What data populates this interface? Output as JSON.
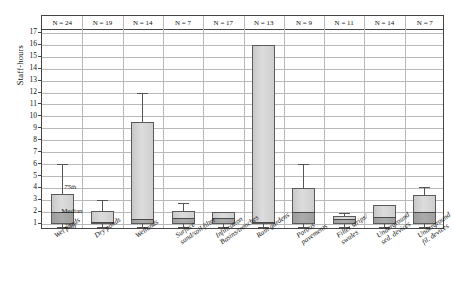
{
  "chart_data": {
    "type": "box",
    "title": "",
    "xlabel": "",
    "ylabel": "Staff-hours",
    "ylim": [
      0.6,
      17
    ],
    "yticks": [
      1,
      2,
      3,
      4,
      5,
      6,
      7,
      8,
      9,
      10,
      11,
      12,
      13,
      14,
      15,
      16,
      17
    ],
    "grid": true,
    "legend": "none",
    "annotations": [
      {
        "text": "75th",
        "refers_to": "box upper edge (75th percentile)"
      },
      {
        "text": "Median",
        "refers_to": "median line inside box"
      },
      {
        "text": "25th",
        "refers_to": "box lower edge (25th percentile)"
      }
    ],
    "categories": [
      "Wet ponds",
      "Dry ponds",
      "Wetlands",
      "Surface sand/soil filter",
      "Infiltration Basins/trenches",
      "Rain gardens",
      "Porous pavements",
      "Filter strips/swales",
      "Underground sed. devices",
      "Underground fil. devices"
    ],
    "category_labels": [
      [
        "Wet ponds"
      ],
      [
        "Dry ponds"
      ],
      [
        "Wetlands"
      ],
      [
        "Surface",
        "sand/soil filter"
      ],
      [
        "Infiltration",
        "Basins/trenches"
      ],
      [
        "Rain gardens"
      ],
      [
        "Porous",
        "pavements"
      ],
      [
        "Filter strips/",
        "swales"
      ],
      [
        "Underground",
        "sed. devices"
      ],
      [
        "Underground",
        "fil. devices"
      ]
    ],
    "n_label_prefix": "N = ",
    "n_values": [
      24,
      19,
      14,
      7,
      17,
      13,
      9,
      11,
      14,
      7
    ],
    "n_labels": [
      "N = 24",
      "N = 19",
      "N = 14",
      "N = 7",
      "N = 17",
      "N = 13",
      "N = 9",
      "N = 11",
      "N = 14",
      "N = 7"
    ],
    "boxes": [
      {
        "category": "Wet ponds",
        "whisker_low": 1.0,
        "q1": 1.0,
        "median": 2.0,
        "q3": 3.5,
        "whisker_high": 6.0
      },
      {
        "category": "Dry ponds",
        "whisker_low": 1.0,
        "q1": 1.0,
        "median": 1.2,
        "q3": 2.1,
        "whisker_high": 3.0
      },
      {
        "category": "Wetlands",
        "whisker_low": 1.0,
        "q1": 1.0,
        "median": 1.4,
        "q3": 9.5,
        "whisker_high": 12.0
      },
      {
        "category": "Surface sand/soil filter",
        "whisker_low": 1.0,
        "q1": 1.0,
        "median": 1.5,
        "q3": 2.1,
        "whisker_high": 2.8
      },
      {
        "category": "Infiltration Basins/trenches",
        "whisker_low": 1.0,
        "q1": 1.0,
        "median": 1.5,
        "q3": 2.0,
        "whisker_high": 2.0
      },
      {
        "category": "Rain gardens",
        "whisker_low": 1.0,
        "q1": 1.0,
        "median": 1.2,
        "q3": 16.0,
        "whisker_high": 16.0
      },
      {
        "category": "Porous pavements",
        "whisker_low": 1.0,
        "q1": 1.0,
        "median": 2.0,
        "q3": 4.0,
        "whisker_high": 6.0
      },
      {
        "category": "Filter strips/swales",
        "whisker_low": 1.0,
        "q1": 1.0,
        "median": 1.4,
        "q3": 1.7,
        "whisker_high": 1.9
      },
      {
        "category": "Underground sed. devices",
        "whisker_low": 1.0,
        "q1": 1.0,
        "median": 1.6,
        "q3": 2.6,
        "whisker_high": 2.6
      },
      {
        "category": "Underground fil. devices",
        "whisker_low": 1.0,
        "q1": 1.0,
        "median": 2.0,
        "q3": 3.4,
        "whisker_high": 4.1
      }
    ]
  },
  "colors": {
    "box_fill_upper": "#d4d4d4",
    "box_fill_lower": "#a4a4a4",
    "box_border": "#5a5a5a",
    "gridline": "#b9b9b9",
    "frame": "#444444",
    "text": "#111111",
    "background": "#ffffff"
  }
}
